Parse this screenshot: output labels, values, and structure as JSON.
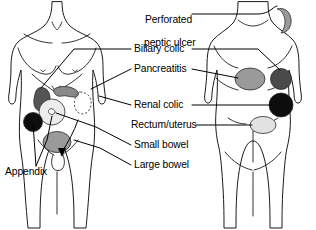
{
  "figure": {
    "views": [
      {
        "name": "front-torso",
        "label": "Anterior torso"
      },
      {
        "name": "back-torso",
        "label": "Posterior torso"
      }
    ]
  },
  "labels": {
    "perforated_peptic_ulcer_line1": "Perforated",
    "perforated_peptic_ulcer_line2": "peptic ulcer",
    "biliary_colic": "Biliary colic",
    "pancreatitis": "Pancreatitis",
    "renal_colic": "Renal colic",
    "rectum_uterus": "Rectum/uterus",
    "small_bowel": "Small bowel",
    "large_bowel": "Large bowel",
    "appendix": "Appendix"
  },
  "colors": {
    "outline": "#1a1a1a",
    "leader": "#000000",
    "background": "#ffffff",
    "black_marker": "#0d0d0d",
    "dark_gray_marker": "#4a4a4a",
    "mid_gray_marker": "#6e6e6e",
    "gray_marker": "#8f8f8f",
    "light_gray_marker": "#d9d9d9",
    "pale_marker": "#ececec"
  },
  "markers": {
    "front": [
      {
        "name": "biliary-colic-marker",
        "color": "#555555",
        "label": "Biliary colic"
      },
      {
        "name": "pancreatitis-marker",
        "color": "#8a8a8a",
        "label": "Pancreatitis"
      },
      {
        "name": "small-bowel-marker",
        "color": "#ececec",
        "label": "Small bowel"
      },
      {
        "name": "appendix-marker",
        "color": "#0d0d0d",
        "label": "Appendix"
      },
      {
        "name": "large-bowel-marker",
        "color": "#9a9a9a",
        "label": "Large bowel"
      },
      {
        "name": "rectum-uterus-outline",
        "color": "#ffffff",
        "label": "Rectum/uterus"
      }
    ],
    "back": [
      {
        "name": "perforated-peptic-ulcer-marker",
        "color": "#9a9a9a",
        "label": "Perforated peptic ulcer"
      },
      {
        "name": "pancreatitis-marker-back",
        "color": "#9a9a9a",
        "label": "Pancreatitis"
      },
      {
        "name": "biliary-colic-marker-back",
        "color": "#4a4a4a",
        "label": "Biliary colic"
      },
      {
        "name": "renal-colic-marker-back",
        "color": "#0d0d0d",
        "label": "Renal colic"
      },
      {
        "name": "rectum-uterus-marker-back",
        "color": "#e2e2e2",
        "label": "Rectum/uterus"
      }
    ]
  }
}
